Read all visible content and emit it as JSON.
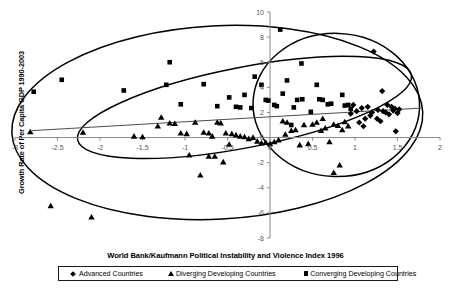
{
  "chart_data": {
    "type": "scatter",
    "title": "",
    "xlabel": "World Bank/Kaufmann Political Instability and Violence Index 1996",
    "ylabel": "Growth Rate of Per Capita GDP 1990-2003",
    "xlim": [
      -3,
      2
    ],
    "ylim": [
      -8,
      10
    ],
    "xticks": [
      -3,
      -2.5,
      -2,
      -1.5,
      -1,
      -0.5,
      0,
      0.5,
      1,
      1.5,
      2
    ],
    "xticklabels": [
      "-3",
      "-2.5",
      "-2",
      "-1.5",
      "-1",
      "-0.5",
      "0",
      "0.5",
      "1",
      "1.5",
      "2"
    ],
    "yticks": [
      -8,
      -6,
      -4,
      -2,
      0,
      2,
      4,
      6,
      8,
      10
    ],
    "yticklabels": [
      "-8",
      "-6",
      "-4",
      "-2",
      "0",
      "2",
      "4",
      "6",
      "8",
      "10"
    ],
    "grid": false,
    "legend_position": "bottom",
    "series": [
      {
        "name": "Advanced Countries",
        "marker": "diamond",
        "color": "#000000",
        "points": [
          [
            1.22,
            6.85
          ],
          [
            1.32,
            3.7
          ],
          [
            1.08,
            2.35
          ],
          [
            1.38,
            2.6
          ],
          [
            1.43,
            2.45
          ],
          [
            1.45,
            2.15
          ],
          [
            1.33,
            2.1
          ],
          [
            1.47,
            2.3
          ],
          [
            1.52,
            2.25
          ],
          [
            1.18,
            1.75
          ],
          [
            1.12,
            1.5
          ],
          [
            1.05,
            1.2
          ],
          [
            0.98,
            2.6
          ],
          [
            1.02,
            2.1
          ],
          [
            1.2,
            2.0
          ],
          [
            1.27,
            2.2
          ],
          [
            1.36,
            2.0
          ],
          [
            1.4,
            1.85
          ],
          [
            1.26,
            1.5
          ],
          [
            1.1,
            0.9
          ],
          [
            1.3,
            1.3
          ],
          [
            1.48,
            0.5
          ],
          [
            0.95,
            1.9
          ],
          [
            1.15,
            2.45
          ],
          [
            1.5,
            1.95
          ]
        ]
      },
      {
        "name": "Diverging Developing Countries",
        "marker": "triangle",
        "color": "#000000",
        "points": [
          [
            -2.82,
            0.45
          ],
          [
            -2.2,
            0.4
          ],
          [
            -1.6,
            0.1
          ],
          [
            -1.5,
            0.05
          ],
          [
            -1.28,
            1.6
          ],
          [
            -1.18,
            1.15
          ],
          [
            -1.12,
            1.1
          ],
          [
            -1.05,
            0.35
          ],
          [
            -0.98,
            0.3
          ],
          [
            -0.88,
            1.2
          ],
          [
            -0.78,
            0.4
          ],
          [
            -0.72,
            0.35
          ],
          [
            -0.62,
            1.2
          ],
          [
            -0.58,
            1.15
          ],
          [
            -0.52,
            0.35
          ],
          [
            -0.45,
            0.3
          ],
          [
            -0.4,
            0.2
          ],
          [
            -0.35,
            0.1
          ],
          [
            -0.3,
            0.05
          ],
          [
            -0.25,
            -0.1
          ],
          [
            -0.2,
            0.0
          ],
          [
            -0.15,
            -0.3
          ],
          [
            -0.1,
            -0.45
          ],
          [
            -0.05,
            -0.4
          ],
          [
            0.0,
            -0.5
          ],
          [
            0.05,
            -0.35
          ],
          [
            0.1,
            -0.2
          ],
          [
            0.15,
            1.3
          ],
          [
            0.2,
            1.2
          ],
          [
            0.25,
            0.55
          ],
          [
            0.3,
            0.6
          ],
          [
            0.35,
            -0.6
          ],
          [
            0.4,
            1.0
          ],
          [
            0.45,
            -0.5
          ],
          [
            0.5,
            1.05
          ],
          [
            0.55,
            1.2
          ],
          [
            0.6,
            0.55
          ],
          [
            0.65,
            0.75
          ],
          [
            0.7,
            -0.35
          ],
          [
            0.75,
            1.05
          ],
          [
            0.8,
            0.95
          ],
          [
            0.85,
            0.6
          ],
          [
            0.88,
            1.25
          ],
          [
            0.92,
            0.9
          ],
          [
            0.62,
            1.5
          ],
          [
            -0.95,
            -1.4
          ],
          [
            -0.72,
            -1.5
          ],
          [
            -0.65,
            -1.5
          ],
          [
            -0.55,
            -1.95
          ],
          [
            -0.82,
            -3.0
          ],
          [
            -2.58,
            -5.45
          ],
          [
            -2.1,
            -6.35
          ],
          [
            0.82,
            -2.2
          ],
          [
            0.75,
            -2.8
          ],
          [
            -1.32,
            0.9
          ],
          [
            -0.68,
            0.1
          ],
          [
            0.18,
            0.25
          ],
          [
            -0.48,
            -0.55
          ]
        ]
      },
      {
        "name": "Converging Developing Countries",
        "marker": "square",
        "color": "#000000",
        "points": [
          [
            0.12,
            8.6
          ],
          [
            0.37,
            5.9
          ],
          [
            -1.18,
            6.0
          ],
          [
            -2.78,
            3.65
          ],
          [
            -2.45,
            4.6
          ],
          [
            -1.72,
            3.75
          ],
          [
            -1.22,
            4.2
          ],
          [
            -0.78,
            4.25
          ],
          [
            -1.05,
            2.65
          ],
          [
            -0.62,
            2.5
          ],
          [
            -0.48,
            3.2
          ],
          [
            -0.4,
            2.45
          ],
          [
            -0.35,
            2.4
          ],
          [
            -0.22,
            2.35
          ],
          [
            -0.18,
            4.85
          ],
          [
            -0.1,
            4.2
          ],
          [
            -0.05,
            3.0
          ],
          [
            -0.02,
            2.95
          ],
          [
            0.08,
            2.5
          ],
          [
            0.15,
            3.5
          ],
          [
            0.2,
            4.55
          ],
          [
            0.28,
            2.4
          ],
          [
            0.32,
            3.0
          ],
          [
            0.38,
            3.05
          ],
          [
            0.55,
            4.2
          ],
          [
            0.58,
            3.05
          ],
          [
            0.62,
            3.0
          ],
          [
            0.68,
            2.65
          ],
          [
            0.72,
            2.7
          ],
          [
            0.85,
            3.4
          ],
          [
            0.88,
            2.55
          ],
          [
            0.92,
            2.6
          ],
          [
            0.48,
            2.05
          ],
          [
            0.05,
            2.6
          ],
          [
            -0.3,
            3.4
          ],
          [
            0.25,
            1.0
          ],
          [
            0.95,
            2.3
          ]
        ]
      }
    ],
    "trendline": {
      "name": "linear-fit",
      "x": [
        -2.8,
        1.78
      ],
      "y": [
        0.55,
        2.35
      ]
    },
    "ellipses": [
      {
        "name": "converging-group-ellipse",
        "cx": -0.62,
        "cy": 1.2,
        "rx": 2.42,
        "ry": 7.7,
        "rotation": -3
      },
      {
        "name": "diverging-group-ellipse",
        "cx": -0.3,
        "cy": 2.4,
        "rx": 2.0,
        "ry": 3.2,
        "rotation": -11
      },
      {
        "name": "advanced-group-ellipse",
        "cx": 0.78,
        "cy": 2.6,
        "rx": 0.98,
        "ry": 5.7,
        "rotation": 2
      }
    ]
  },
  "legend": {
    "items": [
      {
        "label": "Advanced Countries",
        "marker": "diamond"
      },
      {
        "label": "Diverging Developing Countries",
        "marker": "triangle"
      },
      {
        "label": "Converging Developing Countries",
        "marker": "square"
      }
    ]
  }
}
